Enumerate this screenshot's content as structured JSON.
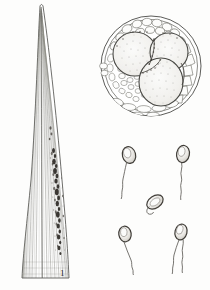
{
  "plate": {
    "background_color": "#fdfdfc",
    "ink_color": "#3a3a38",
    "width": 210,
    "height": 290,
    "type": "scientific-illustration-plate",
    "subject": "botanical / mycological line drawing plate"
  },
  "figures": [
    {
      "id": "figure-1",
      "label": "1",
      "name": "leaf-blade-with-lesion",
      "description": "Elongate lanceolate leaf blade tapering to an acute apex, rendered with dense parallel longitudinal venation; an irregular dark necrotic lesion runs along the right margin of the lower half",
      "ink_color": "#4a4a46",
      "lesion_color": "#2a2724"
    },
    {
      "id": "figure-2",
      "label": "2",
      "name": "zoospores-group",
      "description": "Five zoospores: four pyriform biflagellate or uniflagellate swimming spores with trailing whiplash flagella arranged at the corners, and one rounded encysted spore with a short coiled flagellum at the centre",
      "ink_color": "#4a4a46",
      "spores": [
        {
          "name": "zoospore-top-left",
          "form": "pyriform",
          "flagella": 1,
          "state": "motile"
        },
        {
          "name": "zoospore-top-right",
          "form": "pyriform",
          "flagella": 1,
          "state": "motile"
        },
        {
          "name": "zoospore-centre",
          "form": "rounded",
          "flagella": 1,
          "state": "encysting"
        },
        {
          "name": "zoospore-bottom-left",
          "form": "pyriform",
          "flagella": 1,
          "state": "motile"
        },
        {
          "name": "zoospore-bottom-right",
          "form": "pyriform",
          "flagella": 2,
          "state": "motile"
        }
      ]
    },
    {
      "id": "figure-3",
      "label": "3",
      "name": "tissue-cross-section",
      "description": "Circular transverse section of host tissue showing three large stippled intercellular cavities / sporangial chambers enclosed by a reticulum of thin-walled parenchyma cells, bounded by a double epidermal outline",
      "ink_color": "#4a4a46",
      "cavities": 3,
      "outline": "double-circle"
    }
  ]
}
